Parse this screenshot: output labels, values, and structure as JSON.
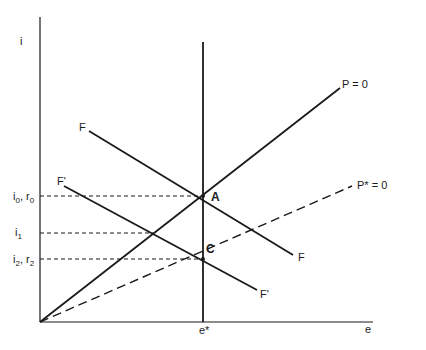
{
  "axes": {
    "y_label": "i",
    "x_label": "e",
    "x_marker_label": "e*"
  },
  "y_ticks": [
    {
      "main": "i",
      "sub": "0",
      "sep": ", ",
      "main2": "r",
      "sub2": "0"
    },
    {
      "main": "i",
      "sub": "1"
    },
    {
      "main": "i",
      "sub": "2",
      "sep": ", ",
      "main2": "r",
      "sub2": "2"
    }
  ],
  "lines": {
    "P": {
      "label": "P = 0",
      "style": "solid"
    },
    "Pstar": {
      "label": "P* = 0",
      "style": "dashed"
    },
    "F_start": "F",
    "F_end": "F",
    "Fprime_start": "F'",
    "Fprime_end": "F'"
  },
  "points": {
    "A": "A",
    "C": "C"
  },
  "colors": {
    "ink": "#1a1a1a",
    "background": "#ffffff"
  }
}
